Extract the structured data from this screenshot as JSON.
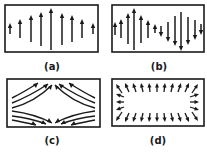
{
  "colors": {
    "ink": "#1a1a1a",
    "background": "#ffffff"
  },
  "panels": [
    {
      "id": "a",
      "label": "(a)",
      "box": {
        "x": 5,
        "y": 5,
        "w": 93,
        "h": 47
      },
      "label_pos": {
        "x": 52,
        "y": 62
      },
      "pattern": "half-wave-uniform-direction",
      "arrows": [
        {
          "x": 10,
          "y1": 34,
          "y2": 23
        },
        {
          "x": 20,
          "y1": 38,
          "y2": 19
        },
        {
          "x": 31,
          "y1": 42,
          "y2": 15
        },
        {
          "x": 41,
          "y1": 46,
          "y2": 12
        },
        {
          "x": 51,
          "y1": 50,
          "y2": 8
        },
        {
          "x": 62,
          "y1": 45,
          "y2": 13
        },
        {
          "x": 72,
          "y1": 42,
          "y2": 15
        },
        {
          "x": 82,
          "y1": 38,
          "y2": 19
        },
        {
          "x": 93,
          "y1": 34,
          "y2": 23
        }
      ]
    },
    {
      "id": "b",
      "label": "(b)",
      "box": {
        "x": 112,
        "y": 5,
        "w": 92,
        "h": 47
      },
      "label_pos": {
        "x": 159,
        "y": 62
      },
      "pattern": "full-wave-alternating-direction",
      "arrows": [
        {
          "x": 115,
          "y1": 35,
          "y2": 22
        },
        {
          "x": 121,
          "y1": 38,
          "y2": 19
        },
        {
          "x": 128,
          "y1": 44,
          "y2": 13
        },
        {
          "x": 134,
          "y1": 50,
          "y2": 8
        },
        {
          "x": 141,
          "y1": 43,
          "y2": 15
        },
        {
          "x": 148,
          "y1": 38,
          "y2": 20
        },
        {
          "x": 155,
          "y1": 33,
          "y2": 24
        },
        {
          "x": 161,
          "y1": 26,
          "y2": 37
        },
        {
          "x": 168,
          "y1": 22,
          "y2": 42
        },
        {
          "x": 175,
          "y1": 16,
          "y2": 46
        },
        {
          "x": 181,
          "y1": 12,
          "y2": 51
        },
        {
          "x": 188,
          "y1": 17,
          "y2": 45
        },
        {
          "x": 195,
          "y1": 20,
          "y2": 40
        },
        {
          "x": 201,
          "y1": 24,
          "y2": 35
        }
      ]
    },
    {
      "id": "c",
      "label": "(c)",
      "box": {
        "x": 7,
        "y": 79,
        "w": 93,
        "h": 48
      },
      "label_pos": {
        "x": 52,
        "y": 136
      },
      "pattern": "hyperbolic-field-lines",
      "curves": [
        {
          "d": "M12,98 Q24,92 38,83",
          "head": [
            38,
            83,
            33,
            84,
            36,
            88
          ]
        },
        {
          "d": "M12,103 Q30,96 48,84",
          "head": [
            48,
            84,
            43,
            85,
            46,
            89
          ]
        },
        {
          "d": "M12,108 Q35,102 52,85",
          "head": [
            52,
            85,
            48,
            87,
            51,
            90
          ]
        },
        {
          "d": "M95,98 Q83,92 69,83",
          "head": [
            69,
            83,
            74,
            84,
            71,
            88
          ]
        },
        {
          "d": "M95,103 Q77,96 59,84",
          "head": [
            59,
            84,
            64,
            85,
            61,
            89
          ]
        },
        {
          "d": "M95,108 Q72,102 55,85",
          "head": [
            55,
            85,
            59,
            87,
            56,
            90
          ]
        },
        {
          "d": "M12,111 Q35,114 52,123",
          "head": [
            52,
            123,
            47,
            122,
            49,
            118
          ]
        },
        {
          "d": "M12,116 Q30,118 46,124",
          "head": [
            46,
            124,
            41,
            124,
            43,
            120
          ]
        },
        {
          "d": "M12,120 Q22,122 36,125",
          "head": [
            36,
            125,
            31,
            125,
            33,
            121
          ]
        },
        {
          "d": "M95,111 Q72,114 55,123",
          "head": [
            55,
            123,
            60,
            122,
            58,
            118
          ]
        },
        {
          "d": "M95,116 Q77,118 61,124",
          "head": [
            61,
            124,
            66,
            124,
            64,
            120
          ]
        },
        {
          "d": "M95,120 Q85,122 71,125",
          "head": [
            71,
            125,
            76,
            125,
            74,
            121
          ]
        }
      ]
    },
    {
      "id": "d",
      "label": "(d)",
      "box": {
        "x": 112,
        "y": 79,
        "w": 92,
        "h": 47
      },
      "label_pos": {
        "x": 158,
        "y": 136
      },
      "pattern": "radial-outward-arrows",
      "center": {
        "x": 158,
        "y": 102.5
      },
      "arrows": [
        {
          "x1": 122,
          "y1": 93,
          "x2": 116,
          "y2": 84
        },
        {
          "x1": 129,
          "y1": 92,
          "x2": 125,
          "y2": 83
        },
        {
          "x1": 136,
          "y1": 92,
          "x2": 133,
          "y2": 83
        },
        {
          "x1": 143,
          "y1": 92,
          "x2": 141,
          "y2": 83
        },
        {
          "x1": 150,
          "y1": 92,
          "x2": 149,
          "y2": 83
        },
        {
          "x1": 157,
          "y1": 92,
          "x2": 157,
          "y2": 83
        },
        {
          "x1": 164,
          "y1": 92,
          "x2": 165,
          "y2": 83
        },
        {
          "x1": 171,
          "y1": 92,
          "x2": 173,
          "y2": 83
        },
        {
          "x1": 178,
          "y1": 92,
          "x2": 181,
          "y2": 83
        },
        {
          "x1": 185,
          "y1": 92,
          "x2": 189,
          "y2": 83
        },
        {
          "x1": 192,
          "y1": 93,
          "x2": 198,
          "y2": 84
        },
        {
          "x1": 124,
          "y1": 97,
          "x2": 116,
          "y2": 94
        },
        {
          "x1": 124,
          "y1": 102,
          "x2": 116,
          "y2": 102
        },
        {
          "x1": 124,
          "y1": 107,
          "x2": 116,
          "y2": 110
        },
        {
          "x1": 190,
          "y1": 97,
          "x2": 199,
          "y2": 94
        },
        {
          "x1": 190,
          "y1": 102,
          "x2": 199,
          "y2": 102
        },
        {
          "x1": 190,
          "y1": 107,
          "x2": 199,
          "y2": 110
        },
        {
          "x1": 122,
          "y1": 112,
          "x2": 116,
          "y2": 121
        },
        {
          "x1": 129,
          "y1": 113,
          "x2": 125,
          "y2": 122
        },
        {
          "x1": 136,
          "y1": 113,
          "x2": 133,
          "y2": 122
        },
        {
          "x1": 143,
          "y1": 113,
          "x2": 141,
          "y2": 122
        },
        {
          "x1": 150,
          "y1": 113,
          "x2": 149,
          "y2": 122
        },
        {
          "x1": 157,
          "y1": 113,
          "x2": 157,
          "y2": 122
        },
        {
          "x1": 164,
          "y1": 113,
          "x2": 165,
          "y2": 122
        },
        {
          "x1": 171,
          "y1": 113,
          "x2": 173,
          "y2": 122
        },
        {
          "x1": 178,
          "y1": 113,
          "x2": 181,
          "y2": 122
        },
        {
          "x1": 185,
          "y1": 113,
          "x2": 189,
          "y2": 122
        },
        {
          "x1": 192,
          "y1": 112,
          "x2": 198,
          "y2": 121
        }
      ]
    }
  ]
}
